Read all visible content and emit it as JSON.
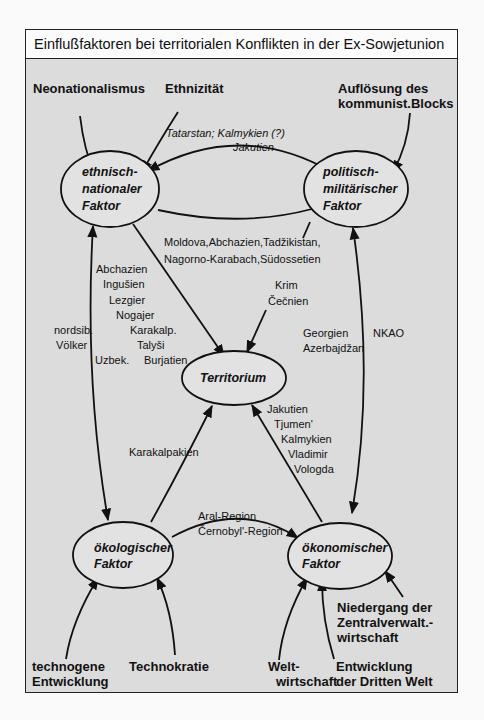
{
  "title": "Einflußfaktoren bei territorialen Konflikten in der Ex-Sowjetunion",
  "colors": {
    "background": "#dcdcdc",
    "title_bar": "#fbfbfb",
    "ink": "#111111"
  },
  "nodes": {
    "ethnic": [
      "ethnisch-",
      "nationaler",
      "Faktor"
    ],
    "political": [
      "politisch-",
      "militärischer",
      "Faktor"
    ],
    "territory": [
      "Territorium"
    ],
    "ecological": [
      "ökologischer",
      "Faktor"
    ],
    "economic": [
      "ökonomischer",
      "Faktor"
    ]
  },
  "influences": {
    "neonationalismus": [
      "Neonationalismus"
    ],
    "ethnizitaet": [
      "Ethnizität"
    ],
    "aufloesung": [
      "Auflösung des",
      "kommunist.Blocks"
    ],
    "technogene": [
      "technogene",
      "Entwicklung"
    ],
    "technokratie": [
      "Technokratie"
    ],
    "weltwirtschaft": [
      "Welt-",
      "wirtschaft"
    ],
    "dritte_welt": [
      "Entwicklung",
      "der Dritten Welt"
    ],
    "niedergang": [
      "Niedergang der",
      "Zentralverwalt.-",
      "wirtschaft"
    ]
  },
  "edge_labels": {
    "ethnic_political_top": [
      "Tatarstan; Kalmykien (?)",
      "Jakutien"
    ],
    "political_territory": [
      "Moldova,Abchazien,Tadžikistan,",
      "Nagorno-Karabach,Südossetien"
    ],
    "krim": [
      "Krim",
      "Čečnien"
    ],
    "ethnic_territory_list": [
      "Abchazien",
      "Ingušien",
      "Lezgier",
      "Nogajer",
      "Karakalp.",
      "Talyši",
      "Burjatien"
    ],
    "nordsib": [
      "nordsib.",
      "Völker"
    ],
    "uzbek": "Uzbek.",
    "georgien": [
      "Georgien",
      "Azerbajdžan"
    ],
    "nkao": "NKAO",
    "karakalpakien": "Karakalpakien",
    "economic_territory": [
      "Jakutien",
      "Tjumen'",
      "Kalmykien",
      "Vladimir",
      "Vologda"
    ],
    "aral": [
      "Aral-Region",
      "Černobyl'-Region"
    ]
  }
}
